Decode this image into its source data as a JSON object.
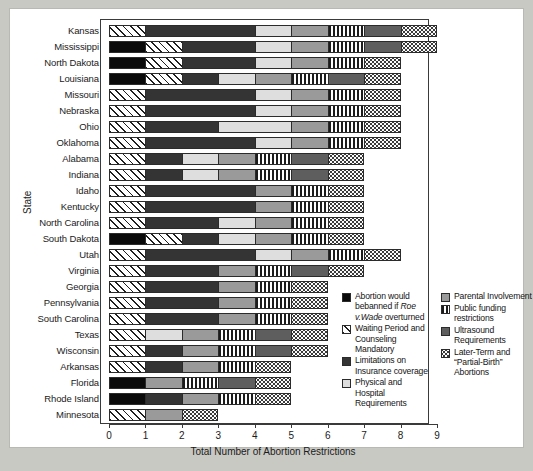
{
  "chart_data": {
    "type": "bar",
    "orientation": "horizontal",
    "stacked": true,
    "title": "",
    "xlabel": "Total Number of Abortion Restrictions",
    "ylabel": "State",
    "xlim": [
      0,
      9
    ],
    "xticks": [
      "0",
      "1",
      "2",
      "3",
      "4",
      "5",
      "6",
      "7",
      "8",
      "9"
    ],
    "grid": false,
    "legend_position": "inside-bottom-right",
    "categories": [
      "Kansas",
      "Mississippi",
      "North Dakota",
      "Louisiana",
      "Missouri",
      "Nebraska",
      "Ohio",
      "Oklahoma",
      "Alabama",
      "Indiana",
      "Idaho",
      "Kentucky",
      "North Carolina",
      "South Dakota",
      "Utah",
      "Virginia",
      "Georgia",
      "Pennsylvania",
      "South Carolina",
      "Texas",
      "Wisconsin",
      "Arkansas",
      "Florida",
      "Rhode Island",
      "Minnesota"
    ],
    "series": [
      {
        "name": "Abortion would be banned if Roe v. Wade overturned",
        "key": "banned",
        "values": [
          0,
          1,
          1,
          1,
          0,
          0,
          0,
          0,
          0,
          0,
          0,
          0,
          0,
          1,
          0,
          0,
          0,
          0,
          0,
          0,
          0,
          0,
          1,
          1,
          0
        ]
      },
      {
        "name": "Waiting Period and Counseling Mandatory",
        "key": "waiting",
        "values": [
          1,
          1,
          1,
          1,
          1,
          1,
          1,
          1,
          1,
          1,
          1,
          1,
          1,
          1,
          1,
          1,
          1,
          1,
          1,
          1,
          1,
          1,
          0,
          0,
          1
        ]
      },
      {
        "name": "Limitations on Insurance coverage",
        "key": "insurance",
        "values": [
          3,
          2,
          2,
          1,
          3,
          3,
          2,
          3,
          1,
          1,
          3,
          3,
          2,
          1,
          3,
          2,
          2,
          2,
          2,
          0,
          1,
          1,
          0,
          1,
          0
        ]
      },
      {
        "name": "Physical and Hospital Requirements",
        "key": "physical",
        "values": [
          1,
          1,
          1,
          1,
          1,
          1,
          2,
          1,
          1,
          1,
          0,
          0,
          1,
          1,
          1,
          0,
          0,
          0,
          0,
          1,
          0,
          0,
          0,
          0,
          0
        ]
      },
      {
        "name": "Parental Involvement",
        "key": "parental",
        "values": [
          1,
          1,
          1,
          1,
          1,
          1,
          1,
          1,
          1,
          1,
          1,
          1,
          1,
          1,
          1,
          1,
          1,
          1,
          1,
          1,
          1,
          1,
          1,
          1,
          1
        ]
      },
      {
        "name": "Public funding restrictions",
        "key": "funding",
        "values": [
          1,
          1,
          1,
          1,
          1,
          1,
          1,
          1,
          1,
          1,
          1,
          1,
          1,
          1,
          1,
          1,
          1,
          1,
          1,
          1,
          1,
          1,
          1,
          1,
          0
        ]
      },
      {
        "name": "Ultrasound Requirements",
        "key": "ultrasound",
        "values": [
          1,
          1,
          0,
          1,
          0,
          0,
          0,
          0,
          1,
          1,
          0,
          0,
          0,
          0,
          0,
          1,
          0,
          0,
          0,
          1,
          1,
          0,
          1,
          0,
          0
        ]
      },
      {
        "name": "Later-Term and \"Partial-Birth\" Abortions",
        "key": "laterterm",
        "values": [
          1,
          1,
          1,
          1,
          1,
          1,
          1,
          1,
          1,
          1,
          1,
          1,
          1,
          1,
          1,
          1,
          1,
          1,
          1,
          1,
          1,
          1,
          1,
          1,
          1
        ]
      }
    ],
    "totals": [
      9,
      9,
      8,
      8,
      8,
      8,
      8,
      8,
      7,
      7,
      7,
      7,
      7,
      7,
      7,
      7,
      6,
      6,
      6,
      6,
      6,
      5,
      5,
      4,
      3
    ]
  },
  "axis": {
    "x_title": "Total Number of Abortion Restrictions",
    "y_title": "State"
  },
  "legend": {
    "columns": [
      {
        "items": [
          {
            "swatch": "black",
            "lines": [
              {
                "t": "Abortion would be"
              },
              {
                "t": "banned if "
              },
              {
                "t": "Roe v.",
                "i": true
              },
              {
                "t": "Wade",
                "i": true
              },
              {
                "t": " overturned"
              }
            ],
            "label": "Abortion would be banned if Roe v. Wade overturned"
          },
          {
            "swatch": "hatch",
            "label": "Waiting Period and Counseling Mandatory"
          },
          {
            "swatch": "darkgray",
            "label": "Limitations on Insurance coverage"
          },
          {
            "swatch": "light",
            "label": "Physical and Hospital Requirements"
          }
        ]
      },
      {
        "items": [
          {
            "swatch": "midgray",
            "label": "Parental Involvement"
          },
          {
            "swatch": "vlines",
            "label": "Public funding restrictions"
          },
          {
            "swatch": "ultragray",
            "label": "Ultrasound Requirements"
          },
          {
            "swatch": "dots",
            "label": "Later-Term and “Partial-Birth” Abortions"
          }
        ]
      }
    ]
  },
  "colors": {
    "banned": "#0a0a0a",
    "waiting": "#ffffff",
    "insurance": "#343434",
    "physical": "#dedede",
    "parental": "#9a9a9a",
    "funding": "#ffffff",
    "ultrasound": "#5e5e5e",
    "laterterm": "#fbfbfb",
    "background": "#c9c9c4",
    "panel": "#ffffff",
    "axis": "#3a3a3a"
  }
}
